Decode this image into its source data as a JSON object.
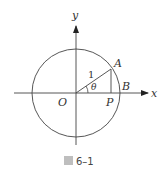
{
  "figure": {
    "caption_glyph": "圖",
    "caption_number": "6–1",
    "axis_labels": {
      "x": "x",
      "y": "y"
    },
    "points": {
      "origin": "O",
      "A": "A",
      "B": "B",
      "P": "P"
    },
    "radius_label": "1",
    "angle_label": "θ",
    "colors": {
      "stroke": "#333333",
      "background": "#ffffff"
    }
  }
}
